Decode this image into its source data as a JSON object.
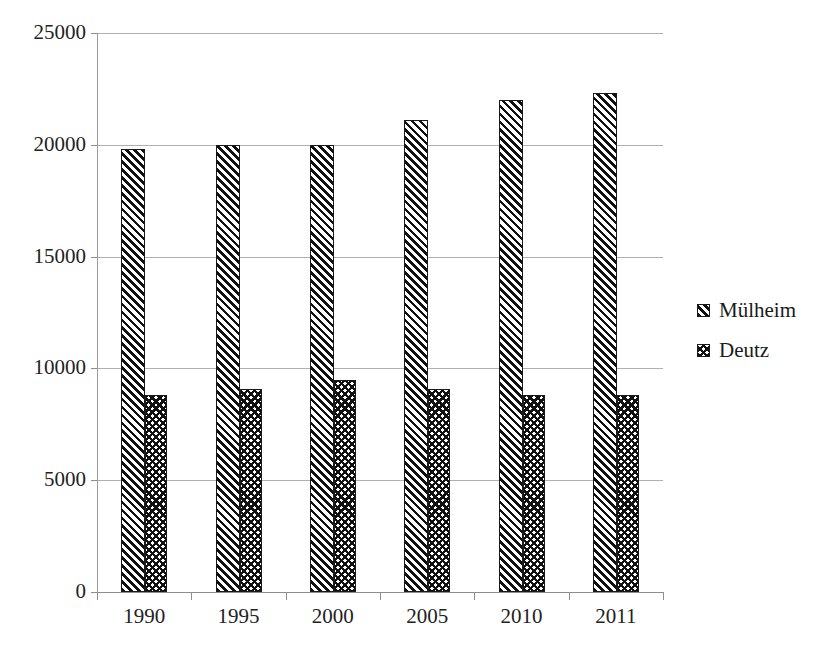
{
  "chart_data": {
    "type": "bar",
    "title": "",
    "subtitle": "",
    "xlabel": "",
    "ylabel": "",
    "categories": [
      "1990",
      "1995",
      "2000",
      "2005",
      "2010",
      "2011"
    ],
    "series": [
      {
        "name": "Mülheim",
        "pattern": "diagonal-hatch",
        "values": [
          19800,
          20000,
          20000,
          21100,
          22000,
          22300
        ]
      },
      {
        "name": "Deutz",
        "pattern": "cross-hatch",
        "values": [
          8800,
          9100,
          9500,
          9100,
          8800,
          8800
        ]
      }
    ],
    "ylim": [
      0,
      25000
    ],
    "ytick_labels": [
      "0",
      "5000",
      "10000",
      "15000",
      "20000",
      "25000"
    ],
    "ytick_values": [
      0,
      5000,
      10000,
      15000,
      20000,
      25000
    ],
    "grid": "horizontal",
    "legend_position": "right",
    "colors": {
      "pattern_ink": "#111111",
      "background": "#ffffff",
      "gridline": "#b0b0b0",
      "axis": "#8d8d8d",
      "text": "#1a1a1a"
    }
  },
  "legend": {
    "entries": [
      {
        "label": "Mülheim"
      },
      {
        "label": "Deutz"
      }
    ]
  }
}
